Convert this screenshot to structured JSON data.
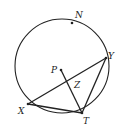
{
  "diagram": {
    "type": "circle-geometry",
    "circle": {
      "center": [
        62,
        66
      ],
      "radius": 47,
      "stroke_width": 1.1
    },
    "points": {
      "N": {
        "label": "N",
        "x": 72,
        "y": 23,
        "label_x": 75,
        "label_y": 18,
        "dot": true
      },
      "Y": {
        "label": "Y",
        "x": 106,
        "y": 58,
        "label_x": 108,
        "label_y": 59,
        "dot": true
      },
      "P": {
        "label": "P",
        "x": 61,
        "y": 70,
        "label_x": 51,
        "label_y": 73,
        "dot": true
      },
      "Z": {
        "label": "Z",
        "x": 68,
        "y": 80,
        "label_x": 74,
        "label_y": 88,
        "dot": false
      },
      "X": {
        "label": "X",
        "x": 28,
        "y": 104,
        "label_x": 18,
        "label_y": 114,
        "dot": true
      },
      "T": {
        "label": "T",
        "x": 82,
        "y": 113,
        "label_x": 83,
        "label_y": 124,
        "dot": true
      }
    },
    "segments": [
      {
        "from": "X",
        "to": "Y"
      },
      {
        "from": "X",
        "to": "T"
      },
      {
        "from": "Y",
        "to": "T"
      },
      {
        "from": "P",
        "to": "T"
      }
    ],
    "colors": {
      "ink": "#222222",
      "background": "#ffffff"
    }
  }
}
